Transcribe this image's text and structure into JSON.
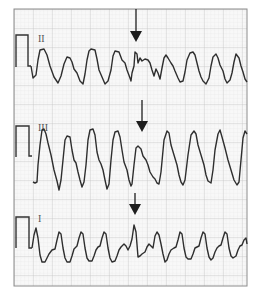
{
  "figure": {
    "type": "ecg_rhythm_strip",
    "leads": [
      {
        "label": "II",
        "arrow_x": 136
      },
      {
        "label": "III",
        "arrow_x": 142
      },
      {
        "label": "I",
        "arrow_x": 135
      }
    ],
    "colors": {
      "background": "#ffffff",
      "paper": "#f7f7f7",
      "minor_grid": "#e2e2e2",
      "major_grid": "#c4c4c4",
      "frame": "#8a8a8a",
      "trace": "#2e2e2e",
      "arrow": "#1e1e1e"
    }
  }
}
